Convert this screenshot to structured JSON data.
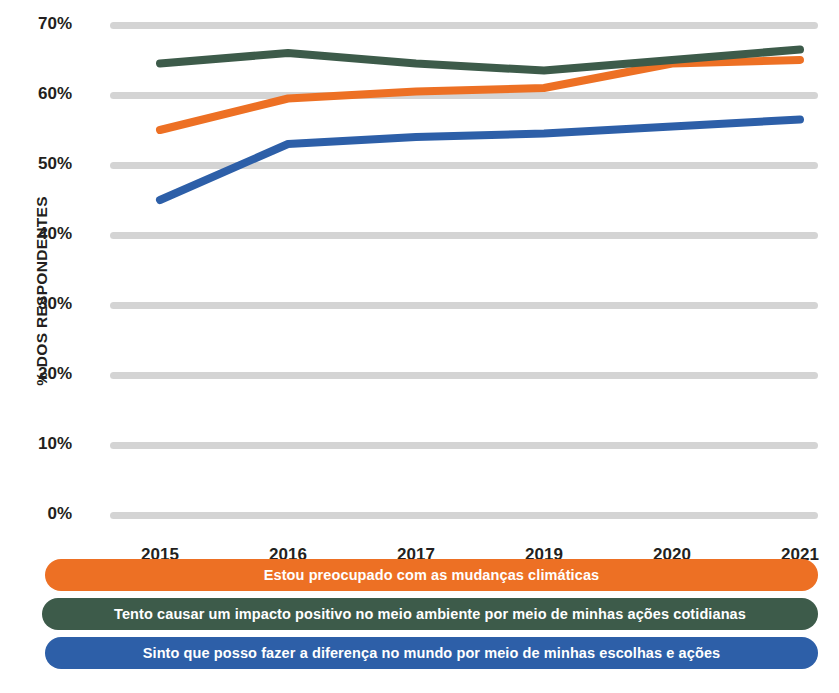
{
  "chart_data": {
    "type": "line",
    "title": "",
    "xlabel": "",
    "ylabel": "% DOS RESPONDENTES",
    "categories": [
      "2015",
      "2016",
      "2017",
      "2019",
      "2020",
      "2021"
    ],
    "ylim": [
      0,
      70
    ],
    "yticks": [
      "0%",
      "10%",
      "20%",
      "30%",
      "40%",
      "50%",
      "60%",
      "70%"
    ],
    "ytick_values": [
      0,
      10,
      20,
      30,
      40,
      50,
      60,
      70
    ],
    "grid": true,
    "legend_position": "bottom",
    "series": [
      {
        "name": "Estou preocupado com as mudanças climáticas",
        "color": "#ED7024",
        "values": [
          55,
          59.5,
          60.5,
          61,
          64.5,
          65
        ]
      },
      {
        "name": "Tento causar um impacto positivo no meio ambiente por meio de minhas ações cotidianas",
        "color": "#3D5B4A",
        "values": [
          64.5,
          66,
          64.5,
          63.5,
          65,
          66.5
        ]
      },
      {
        "name": "Sinto que posso fazer a diferença no mundo por meio de minhas escolhas e ações",
        "color": "#2D5FA8",
        "values": [
          45,
          53,
          54,
          54.5,
          55.5,
          56.5
        ]
      }
    ]
  },
  "axis": {
    "y_title": "% DOS RESPONDENTES"
  },
  "legend": {
    "items": [
      {
        "label": "Estou preocupado com as mudanças climáticas",
        "color": "#ED7024"
      },
      {
        "label": "Tento causar um impacto positivo no meio ambiente por meio de minhas ações cotidianas",
        "color": "#3D5B4A"
      },
      {
        "label": "Sinto que posso fazer a diferença no mundo por meio de minhas escolhas e ações",
        "color": "#2D5FA8"
      }
    ]
  },
  "colors": {
    "gridline": "#d4d4d4",
    "text": "#231f20",
    "background": "#ffffff"
  }
}
